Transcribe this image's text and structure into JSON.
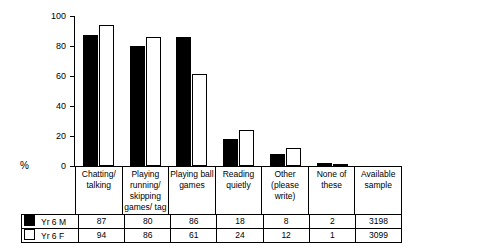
{
  "chart_data": {
    "type": "bar",
    "title": "",
    "xlabel": "",
    "ylabel": "%",
    "ylim": [
      0,
      100
    ],
    "yticks": [
      0,
      20,
      40,
      60,
      80,
      100
    ],
    "grid": false,
    "legend_position": "bottom-table",
    "categories": [
      "Chatting/ talking",
      "Playing running/ skipping games/ tag",
      "Playing ball games",
      "Reading quietly",
      "Other (please write)",
      "None of these",
      "Available sample"
    ],
    "series": [
      {
        "name": "Yr 6 M",
        "swatch": "filled",
        "values": [
          87,
          80,
          86,
          18,
          8,
          2,
          3198
        ]
      },
      {
        "name": "Yr 6 F",
        "swatch": "hollow",
        "values": [
          94,
          86,
          61,
          24,
          12,
          1,
          3099
        ]
      }
    ]
  },
  "axis": {
    "y_label": "%",
    "ticks": [
      "100",
      "80",
      "60",
      "40",
      "20",
      "0"
    ]
  },
  "categories": [
    {
      "lines": [
        "Chatting/",
        "talking"
      ]
    },
    {
      "lines": [
        "Playing",
        "running/",
        "skipping",
        "games/ tag"
      ]
    },
    {
      "lines": [
        "Playing ball",
        "games"
      ]
    },
    {
      "lines": [
        "Reading",
        "quietly"
      ]
    },
    {
      "lines": [
        "Other",
        "(please",
        "write)"
      ]
    },
    {
      "lines": [
        "None of these"
      ]
    },
    {
      "lines": [
        "Available",
        "sample"
      ]
    }
  ],
  "table": {
    "rows": [
      {
        "label": "Yr 6 M",
        "swatch": "filled",
        "values": [
          "87",
          "80",
          "86",
          "18",
          "8",
          "2",
          "3198"
        ]
      },
      {
        "label": "Yr 6 F",
        "swatch": "hollow",
        "values": [
          "94",
          "86",
          "61",
          "24",
          "12",
          "1",
          "3099"
        ]
      }
    ]
  }
}
